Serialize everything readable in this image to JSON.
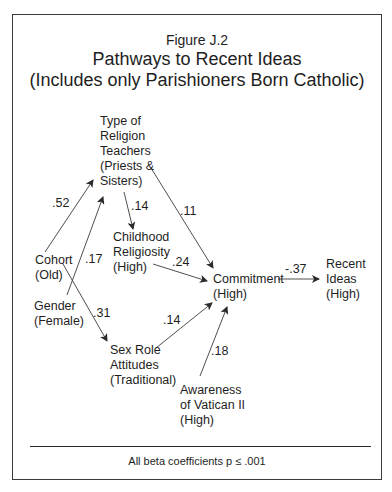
{
  "figure": {
    "label": "Figure J.2",
    "title": "Pathways to Recent Ideas",
    "subtitle": "(Includes only Parishioners Born Catholic)"
  },
  "nodes": {
    "type_of_teachers": "Type of\nReligion\nTeachers\n(Priests &\nSisters)",
    "cohort": "Cohort\n(Old)",
    "gender": "Gender\n(Female)",
    "childhood_religiosity": "Childhood\nReligiosity\n(High)",
    "sex_role_attitudes": "Sex Role\nAttitudes\n(Traditional)",
    "commitment": "Commitment\n(High)",
    "awareness_vatican": "Awareness\nof Vatican II\n(High)",
    "recent_ideas": "Recent\nIdeas\n(High)"
  },
  "paths": [
    {
      "from": "Cohort (Old)",
      "to": "Type of Religion Teachers",
      "coef": ".52"
    },
    {
      "from": "Gender (Female)",
      "to": "Type of Religion Teachers",
      "coef": ".17"
    },
    {
      "from": "Type of Religion Teachers",
      "to": "Childhood Religiosity",
      "coef": ".14"
    },
    {
      "from": "Type of Religion Teachers",
      "to": "Commitment",
      "coef": ".11"
    },
    {
      "from": "Childhood Religiosity",
      "to": "Commitment",
      "coef": ".24"
    },
    {
      "from": "Cohort (Old)",
      "to": "Sex Role Attitudes",
      "coef": ".31"
    },
    {
      "from": "Sex Role Attitudes",
      "to": "Commitment",
      "coef": ".14"
    },
    {
      "from": "Awareness of Vatican II",
      "to": "Commitment",
      "coef": ".18"
    },
    {
      "from": "Commitment",
      "to": "Recent Ideas",
      "coef": "-.37"
    }
  ],
  "footnote": "All beta coefficients p ≤ .001"
}
